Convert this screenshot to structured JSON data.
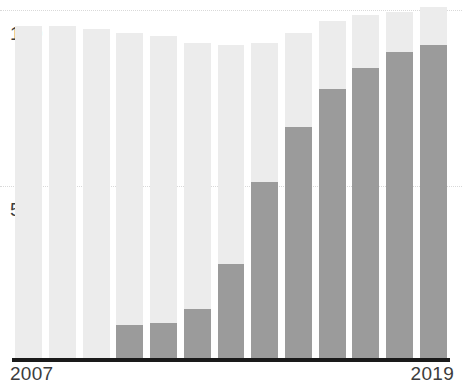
{
  "chart_data": {
    "type": "bar",
    "title": "",
    "subtitle": "",
    "xlabel": "",
    "ylabel": "",
    "ylim": [
      0,
      105
    ],
    "grid": true,
    "grid_axis": "y",
    "legend": false,
    "stacked": true,
    "categories": [
      "2007",
      "2008",
      "2009",
      "2010",
      "2011",
      "2012",
      "2013",
      "2014",
      "2015",
      "2016",
      "2017",
      "2018",
      "2019"
    ],
    "x_tick_labels_shown": [
      "2007",
      "2019"
    ],
    "y_tick_labels_shown": [
      "100",
      "50"
    ],
    "y_ticks": [
      50,
      100
    ],
    "series": [
      {
        "name": "filled",
        "color": "#9b9b9b",
        "values": [
          0,
          0,
          0,
          10,
          10.5,
          14.5,
          27.5,
          51,
          66.5,
          77.5,
          83.5,
          88,
          90
        ]
      },
      {
        "name": "remainder",
        "color": "#ececec",
        "values": [
          95.5,
          95.5,
          94.5,
          93.5,
          92,
          90.5,
          62.5,
          39.5,
          27,
          19.5,
          15,
          11.5,
          11
        ]
      }
    ],
    "totals": [
      95.5,
      95.5,
      94.5,
      93.5,
      92.5,
      90.5,
      90,
      90.5,
      93.5,
      97,
      98.5,
      99.5,
      101
    ]
  },
  "axis": {
    "y_label_100": "100",
    "y_label_50": "50",
    "x_label_first": "2007",
    "x_label_last": "2019"
  },
  "colors": {
    "bar_light": "#ececec",
    "bar_dark": "#9b9b9b",
    "gridline": "#d9d9d9",
    "axis_line": "#1a1a1a",
    "text": "#3c3c3c",
    "background": "#ffffff"
  }
}
